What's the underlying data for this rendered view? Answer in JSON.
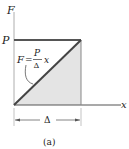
{
  "figure": {
    "caption": "(a)",
    "axes": {
      "y_label": "F",
      "x_label": "x",
      "y_tick_label": "P"
    },
    "equation": {
      "lhs": "F",
      "equals": "=",
      "numerator": "P",
      "denominator": "Δ",
      "variable": "x"
    },
    "dimension": {
      "label": "Δ"
    },
    "colors": {
      "line": "#444444",
      "shade": "#e4e4e4",
      "thin": "#999999"
    }
  }
}
